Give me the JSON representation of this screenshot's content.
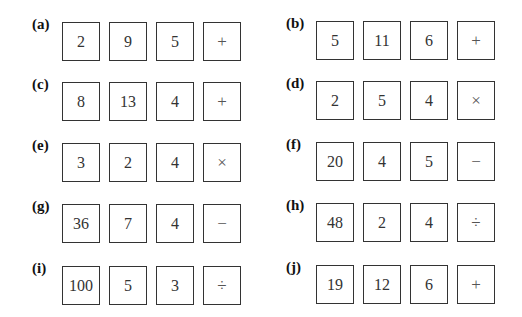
{
  "problems": [
    {
      "label": "(a)",
      "numbers": [
        "2",
        "9",
        "5"
      ],
      "operation": "+"
    },
    {
      "label": "(b)",
      "numbers": [
        "5",
        "11",
        "6"
      ],
      "operation": "+"
    },
    {
      "label": "(c)",
      "numbers": [
        "8",
        "13",
        "4"
      ],
      "operation": "+"
    },
    {
      "label": "(d)",
      "numbers": [
        "2",
        "5",
        "4"
      ],
      "operation": "×"
    },
    {
      "label": "(e)",
      "numbers": [
        "3",
        "2",
        "4"
      ],
      "operation": "×"
    },
    {
      "label": "(f)",
      "numbers": [
        "20",
        "4",
        "5"
      ],
      "operation": "−"
    },
    {
      "label": "(g)",
      "numbers": [
        "36",
        "7",
        "4"
      ],
      "operation": "−"
    },
    {
      "label": "(h)",
      "numbers": [
        "48",
        "2",
        "4"
      ],
      "operation": "÷"
    },
    {
      "label": "(i)",
      "numbers": [
        "100",
        "5",
        "3"
      ],
      "operation": "÷"
    },
    {
      "label": "(j)",
      "numbers": [
        "19",
        "12",
        "6"
      ],
      "operation": "+"
    }
  ]
}
